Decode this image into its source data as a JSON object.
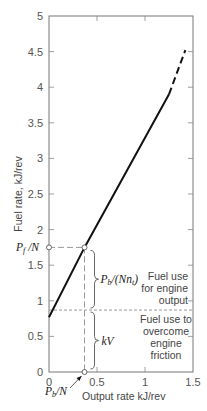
{
  "chart_data": {
    "type": "line",
    "title": "",
    "xlabel": "Output rate kJ/rev",
    "ylabel": "Fuel rate, kJ/rev",
    "xlim": [
      0,
      1.5
    ],
    "ylim": [
      0,
      5
    ],
    "grid": false,
    "x_ticks": [
      0,
      0.5,
      1,
      1.5
    ],
    "x_tick_labels": [
      "0",
      "0.5",
      "1",
      "1.5"
    ],
    "y_ticks": [
      0,
      0.5,
      1,
      1.5,
      2,
      2.5,
      3,
      3.5,
      4,
      4.5,
      5
    ],
    "y_tick_labels": [
      "0",
      "0.5",
      "1",
      "1.5",
      "2",
      "2.5",
      "3",
      "3.5",
      "4",
      "4.5",
      "5"
    ],
    "series": [
      {
        "name": "Fuel rate (solid)",
        "style": "solid",
        "x": [
          0,
          0.37,
          1.25
        ],
        "y": [
          0.77,
          1.75,
          3.9
        ]
      },
      {
        "name": "Fuel rate (extrapolated)",
        "style": "dashed",
        "x": [
          1.25,
          1.42
        ],
        "y": [
          3.9,
          4.52
        ]
      }
    ],
    "reference_lines": {
      "friction_level_y": 0.87,
      "operating_point_x": 0.37,
      "operating_point_y": 1.75
    },
    "annotations": {
      "pf_label": "P",
      "pf_sub": "f",
      "pf_suffix": " /N",
      "pb_label": "P",
      "pb_sub": "b",
      "pb_suffix": "/N",
      "engine_term_prefix": "P",
      "engine_term_sub": "b",
      "engine_term_mid": "/(Nn",
      "engine_term_sub2": "t",
      "engine_term_suffix": ")",
      "kv_label": "kV",
      "engine_output_lines": [
        "Fuel use",
        "for engine",
        "output"
      ],
      "friction_lines": [
        "Fuel use to",
        "overcome",
        "engine",
        "friction"
      ]
    }
  }
}
